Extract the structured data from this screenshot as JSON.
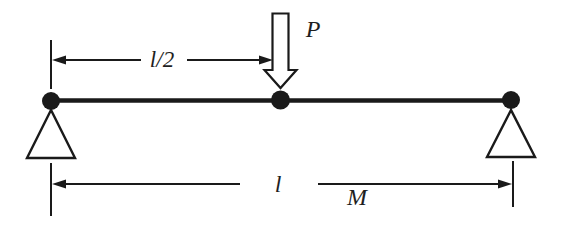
{
  "figure": {
    "kind": "simply-supported-beam-with-midspan-point-load",
    "labels": {
      "load": "P",
      "half_span": "l/2",
      "span": "l",
      "mass": "M"
    },
    "colors": {
      "line": "#1a1a1a",
      "node_fill": "#1a1a1a",
      "load_arrow_fill": "#ffffff",
      "background": "#ffffff",
      "text": "#1f1f1f"
    },
    "icons": {
      "load_arrow": "hollow-down-arrow-icon",
      "left_support": "pin-support-triangle-icon",
      "right_support": "pin-support-triangle-icon",
      "beam_nodes": "filled-circle-icon",
      "dimension_ends": "filled-arrowhead-icon"
    }
  }
}
